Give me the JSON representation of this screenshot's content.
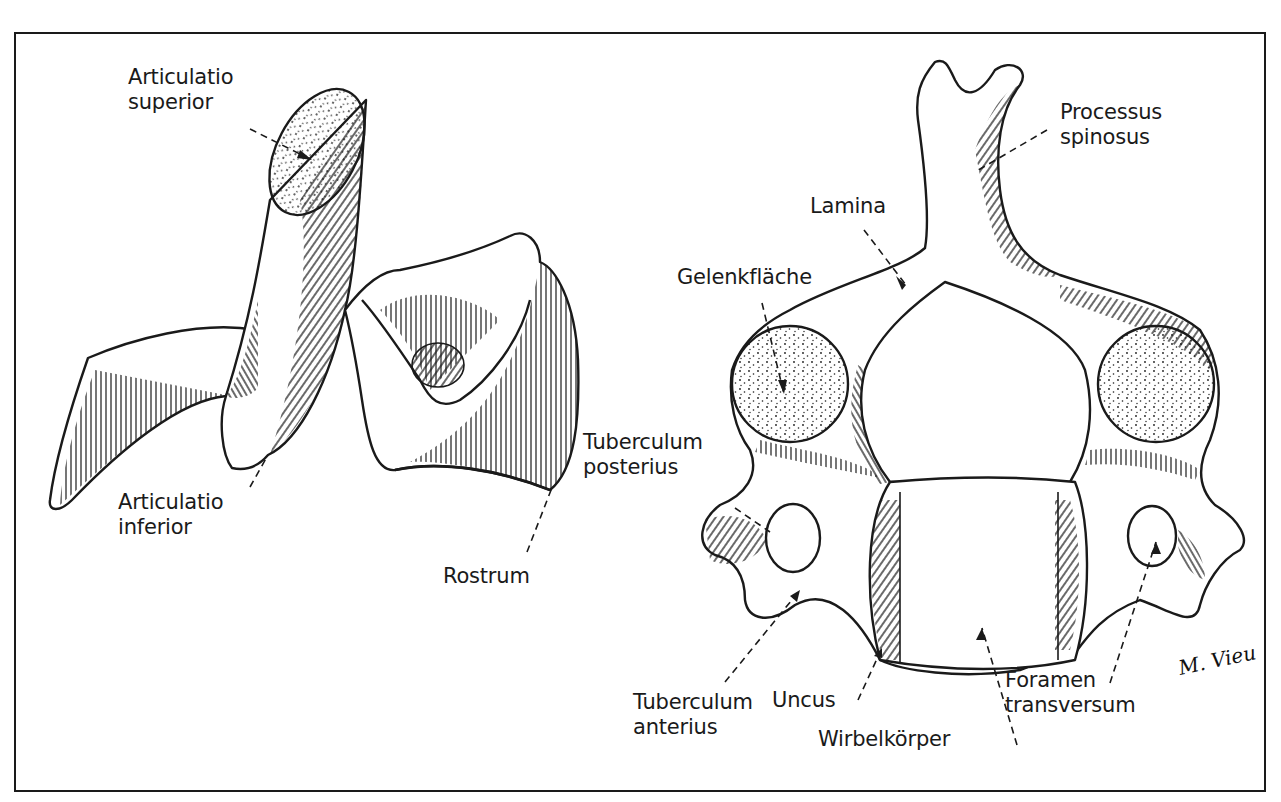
{
  "figure": {
    "left_view": {
      "description": "Cervical vertebra, lateral view",
      "labels": {
        "articulatio_superior": [
          "Articulatio",
          "superior"
        ],
        "articulatio_inferior": [
          "Articulatio",
          "inferior"
        ],
        "rostrum": "Rostrum"
      }
    },
    "right_view": {
      "description": "Cervical vertebra, cranial view",
      "labels": {
        "processus_spinosus": [
          "Processus",
          "spinosus"
        ],
        "lamina": "Lamina",
        "gelenkflaeche": "Gelenkfläche",
        "tuberculum_posterius": [
          "Tuberculum",
          "posterius"
        ],
        "tuberculum_anterius": [
          "Tuberculum",
          "anterius"
        ],
        "uncus": "Uncus",
        "wirbelkoerper": "Wirbelkörper",
        "foramen_transversum": [
          "Foramen",
          "transversum"
        ]
      }
    },
    "signature": "M. Vieu",
    "colors": {
      "ink": "#1a1a1a",
      "background": "#ffffff"
    }
  }
}
